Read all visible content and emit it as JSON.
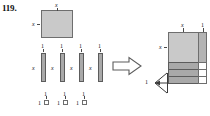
{
  "problem": {
    "number": "119."
  },
  "colors": {
    "tile_fill": "#c9c9c9",
    "tile_fill_dark": "#a9a9a9",
    "tile_border": "#6e6e6e",
    "white_fill": "#ffffff",
    "text": "#1a1a1a"
  },
  "figure": {
    "type": "algebra-tiles-rectangle-assembly",
    "left_group": {
      "x_squared_tile": {
        "count": 1,
        "top_label": "x",
        "left_label": "x"
      },
      "x_tiles": {
        "count": 4,
        "top_label": "1",
        "left_label": "x",
        "labels_top": [
          "1",
          "1",
          "1",
          "1"
        ],
        "labels_left": [
          "x",
          "x",
          "x",
          "x"
        ]
      },
      "unit_tiles": {
        "count": 3,
        "top_label": "1",
        "left_label": "1",
        "labels_top": [
          "1",
          "1",
          "1"
        ],
        "labels_left": [
          "1",
          "1",
          "1"
        ]
      }
    },
    "arrow": {
      "icon": "arrow-right-icon",
      "direction": "right"
    },
    "right_group": {
      "top_labels": [
        "x",
        "1"
      ],
      "left_label": "x",
      "bracket_label": "1",
      "strip_rows": 3,
      "right_column_cells": 3
    }
  }
}
